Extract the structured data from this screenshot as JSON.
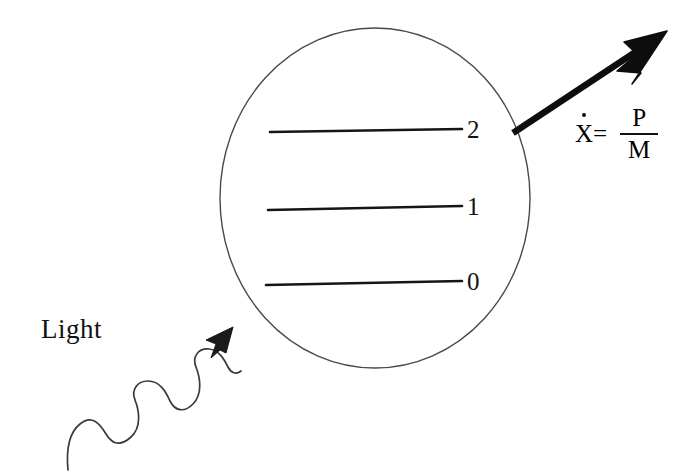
{
  "figure": {
    "background_color": "#ffffff",
    "stroke_color": "#111111",
    "width": 693,
    "height": 473
  },
  "atom": {
    "shape_name": "atom-circle",
    "center_x": 375,
    "center_y": 198,
    "radius_x": 155,
    "radius_y": 170,
    "stroke_color": "#4a4a4a",
    "stroke_width": 1.4,
    "fill": "none"
  },
  "energy_levels": [
    {
      "label": "2",
      "y": 131,
      "x_start": 270,
      "x_end": 462,
      "label_x": 467
    },
    {
      "label": "1",
      "y": 208,
      "x_start": 268,
      "x_end": 462,
      "label_x": 467
    },
    {
      "label": "0",
      "y": 283,
      "x_start": 266,
      "x_end": 462,
      "label_x": 467
    }
  ],
  "light": {
    "label": "Light",
    "label_x": 41,
    "label_y": 316,
    "wave_start_x": 68,
    "wave_start_y": 470,
    "arrow_tip_x": 233,
    "arrow_tip_y": 327,
    "stroke_color": "#3a3a3a",
    "stroke_width": 1.6
  },
  "recoil_arrow": {
    "start_x": 513,
    "start_y": 133,
    "tip_x": 667,
    "tip_y": 31,
    "stroke_color": "#0d0d0d",
    "stroke_width": 6,
    "head_length": 40,
    "head_width": 26
  },
  "equation": {
    "variable": "X",
    "dot_accent": "·",
    "equals": "=",
    "numerator": "P",
    "denominator": "M",
    "full_text": "Ẋ = P/M",
    "x": 575,
    "y": 104
  }
}
